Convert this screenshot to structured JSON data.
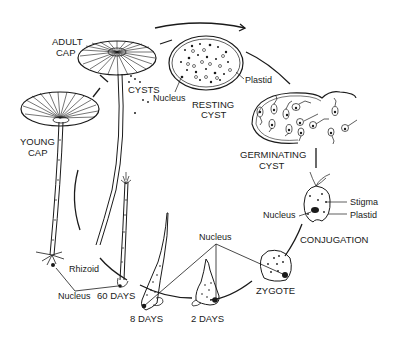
{
  "diagram": {
    "type": "life-cycle",
    "colors": {
      "ink": "#1a1a1a",
      "background": "#ffffff"
    },
    "stages": {
      "adult_cap": {
        "line1": "ADULT",
        "line2": "CAP"
      },
      "cysts": "CYSTS",
      "resting_cyst": {
        "line1": "RESTING",
        "line2": "CYST"
      },
      "germinating_cyst": {
        "line1": "GERMINATING",
        "line2": "CYST"
      },
      "conjugation": "CONJUGATION",
      "zygote": "ZYGOTE",
      "day2": "2 DAYS",
      "day8": "8 DAYS",
      "day60": "60 DAYS",
      "young_cap": {
        "line1": "YOUNG",
        "line2": "CAP"
      }
    },
    "annotations": {
      "resting_nucleus": "Nucleus",
      "resting_plastid": "Plastid",
      "gamete_stigma": "Stigma",
      "gamete_plastid": "Plastid",
      "gamete_nucleus": "Nucleus",
      "early_nucleus": "Nucleus",
      "rhizoid": "Rhizoid",
      "rhizoid_nucleus": "Nucleus"
    }
  }
}
